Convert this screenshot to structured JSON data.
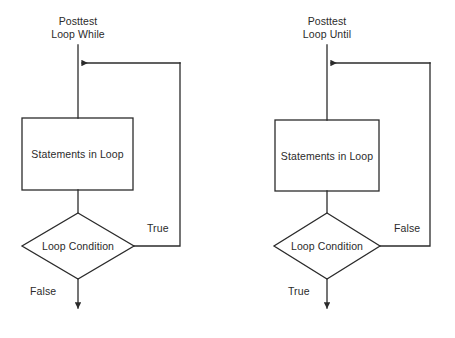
{
  "figure": {
    "background_color": "#ffffff",
    "stroke_color": "#2b2b2b",
    "text_color": "#2b2b2b"
  },
  "diagrams": [
    {
      "id": "posttest-loop-while",
      "title_line1": "Posttest",
      "title_line2": "Loop While",
      "process_label": "Statements in Loop",
      "decision_label": "Loop Condition",
      "loop_back_label": "True",
      "exit_label": "False"
    },
    {
      "id": "posttest-loop-until",
      "title_line1": "Posttest",
      "title_line2": "Loop Until",
      "process_label": "Statements in Loop",
      "decision_label": "Loop Condition",
      "loop_back_label": "False",
      "exit_label": "True"
    }
  ]
}
